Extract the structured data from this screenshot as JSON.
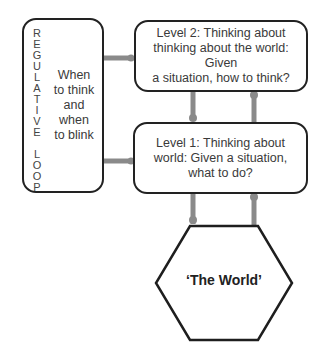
{
  "regulative_loop": {
    "vertical_label": [
      "R",
      "E",
      "G",
      "U",
      "L",
      "A",
      "T",
      "I",
      "V",
      "E",
      " ",
      "L",
      "O",
      "O",
      "P"
    ],
    "text_lines": [
      "When",
      "to think",
      "and when",
      "to blink"
    ]
  },
  "level2": {
    "lines": [
      "Level 2: Thinking about",
      "thinking about the world: Given",
      "a situation, how to think?"
    ]
  },
  "level1": {
    "lines": [
      "Level 1: Thinking about",
      "world: Given a situation,",
      "what to do?"
    ]
  },
  "world": {
    "label": "‘The World’"
  },
  "colors": {
    "connector": "#8a8a8a",
    "border": "#222222",
    "text": "#3a3a3a"
  }
}
